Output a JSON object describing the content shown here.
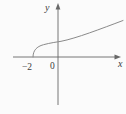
{
  "figure": {
    "background": "#fbfbfb",
    "axis_color": "#686868",
    "curve_color": "#8a8a8a",
    "label_color": "#3c3c3c"
  },
  "labels": {
    "y_axis": "y",
    "x_axis": "x",
    "origin": "0",
    "x_intercept": "−2"
  },
  "chart_data": {
    "type": "line",
    "title": "",
    "xlabel": "x",
    "ylabel": "y",
    "x_tick_labels": [
      "-2",
      "0"
    ],
    "series": [
      {
        "name": "y = sqrt(x + 2)",
        "x": [
          -2,
          -1.75,
          -1.5,
          -1,
          -0.5,
          0,
          1,
          2,
          3,
          4,
          5
        ],
        "y": [
          0,
          0.5,
          0.71,
          1,
          1.22,
          1.41,
          1.73,
          2,
          2.24,
          2.45,
          2.65
        ]
      }
    ],
    "xlim": [
      -3.6,
      5.1
    ],
    "ylim": [
      -4,
      4.5
    ],
    "grid": false,
    "legend": false,
    "render": {
      "width": 126,
      "height": 114,
      "origin_px": [
        58,
        57
      ],
      "x_unit_px": 12.5,
      "x_axis_d": "M 13 57 H 116",
      "y_axis_d": "M 58 8 V 105",
      "x_arrow_points": "121,57 114.5,54.6 114.5,59.4",
      "y_arrow_points": "58,3 55.6,9.5 60.4,9.5",
      "curve_path_px": "M 33 57 C 33 50.5 36.5 46.6 43.5 44.7 C 51 42.7 56 42.2 61 41.3 C 76 38.4 101 28.8 123 20.5"
    }
  }
}
